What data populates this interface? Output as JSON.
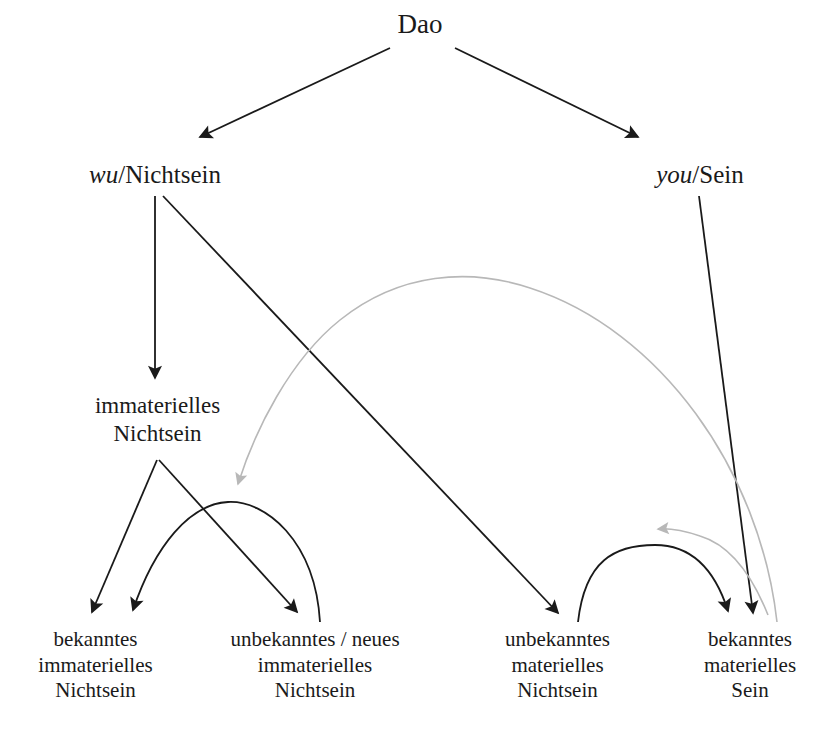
{
  "diagram": {
    "type": "tree-with-cross-links",
    "background_color": "#ffffff",
    "edge_colors": {
      "primary": "#1a1a1a",
      "secondary": "#bfbfbf"
    },
    "nodes": {
      "root": {
        "label": "Dao"
      },
      "wu": {
        "italic_part": "wu",
        "rest": "/Nichtsein"
      },
      "you": {
        "italic_part": "you",
        "rest": "/Sein"
      },
      "immaterielles_nichtsein": {
        "line1": "immaterielles",
        "line2": "Nichtsein"
      },
      "bekanntes_immaterielles_nichtsein": {
        "line1": "bekanntes",
        "line2": "immaterielles",
        "line3": "Nichtsein"
      },
      "unbekanntes_neues_immaterielles_nichtsein": {
        "line1": "unbekanntes / neues",
        "line2": "immaterielles",
        "line3": "Nichtsein"
      },
      "unbekanntes_materielles_nichtsein": {
        "line1": "unbekanntes",
        "line2": "materielles",
        "line3": "Nichtsein"
      },
      "bekanntes_materielles_sein": {
        "line1": "bekanntes",
        "line2": "materielles",
        "line3": "Sein"
      }
    },
    "edges": [
      {
        "name": "dao-to-wu",
        "color": "#1a1a1a",
        "style": "straight",
        "arrowhead": "end"
      },
      {
        "name": "dao-to-you",
        "color": "#1a1a1a",
        "style": "straight",
        "arrowhead": "end"
      },
      {
        "name": "wu-to-immaterielles-nichtsein",
        "color": "#1a1a1a",
        "style": "straight",
        "arrowhead": "end"
      },
      {
        "name": "wu-to-unbekanntes-materielles-nichtsein",
        "color": "#1a1a1a",
        "style": "straight",
        "arrowhead": "end"
      },
      {
        "name": "you-to-bekanntes-materielles-sein",
        "color": "#1a1a1a",
        "style": "straight",
        "arrowhead": "end"
      },
      {
        "name": "immaterielles-to-bekanntes-immaterielles",
        "color": "#1a1a1a",
        "style": "straight",
        "arrowhead": "end"
      },
      {
        "name": "immaterielles-to-unbekanntes-neues-immaterielles",
        "color": "#1a1a1a",
        "style": "straight",
        "arrowhead": "end"
      },
      {
        "name": "unbekanntes-neues-to-bekanntes-immaterielles-curve",
        "color": "#1a1a1a",
        "style": "curved",
        "arrowhead": "end"
      },
      {
        "name": "unbekanntes-materielles-to-bekanntes-materielles-curve",
        "color": "#1a1a1a",
        "style": "curved",
        "arrowhead": "end"
      },
      {
        "name": "bekanntes-materielles-sein-to-immaterielles-long-curve",
        "color": "#bfbfbf",
        "style": "curved",
        "arrowhead": "end"
      },
      {
        "name": "bekanntes-materielles-sein-to-unbekanntes-materielles-curve",
        "color": "#bfbfbf",
        "style": "curved",
        "arrowhead": "end"
      }
    ]
  }
}
